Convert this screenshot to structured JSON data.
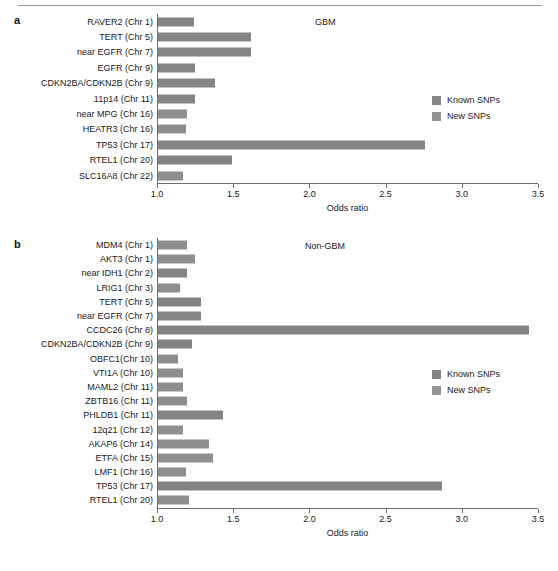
{
  "figure": {
    "axis_title": "Odds ratio",
    "legend": {
      "known_label": "Known SNPs",
      "new_label": "New SNPs",
      "known_color": "#848484",
      "new_color": "#949494"
    },
    "tick_labels": [
      "1.0",
      "1.5",
      "2.0",
      "2.5",
      "3.0",
      "3.5"
    ],
    "xlim": [
      1.0,
      3.5
    ]
  },
  "panels": [
    {
      "letter": "a",
      "title": "GBM"
    },
    {
      "letter": "b",
      "title": "Non-GBM"
    }
  ],
  "chart_data": [
    {
      "type": "bar",
      "orientation": "horizontal",
      "title": "GBM",
      "panel": "a",
      "xlabel": "Odds ratio",
      "ylabel": "",
      "xlim": [
        1.0,
        3.5
      ],
      "xticks": [
        1.0,
        1.5,
        2.0,
        2.5,
        3.0,
        3.5
      ],
      "grid": false,
      "legend": [
        "Known SNPs",
        "New SNPs"
      ],
      "legend_position": "right",
      "categories": [
        "RAVER2 (Chr 1)",
        "TERT (Chr 5)",
        "near EGFR (Chr 7)",
        "EGFR (Chr 9)",
        "CDKN2BA/CDKN2B (Chr 9)",
        "11p14 (Chr 11)",
        "near MPG (Chr 16)",
        "HEATR3 (Chr 16)",
        "TP53 (Chr 17)",
        "RTEL1 (Chr 20)",
        "SLC16A8 (Chr 22)"
      ],
      "values": [
        1.24,
        1.62,
        1.62,
        1.25,
        1.38,
        1.25,
        1.2,
        1.19,
        2.76,
        1.49,
        1.17
      ],
      "series_of": [
        "Known SNPs",
        "Known SNPs",
        "Known SNPs",
        "Known SNPs",
        "Known SNPs",
        "Known SNPs",
        "New SNPs",
        "New SNPs",
        "Known SNPs",
        "Known SNPs",
        "New SNPs"
      ]
    },
    {
      "type": "bar",
      "orientation": "horizontal",
      "title": "Non-GBM",
      "panel": "b",
      "xlabel": "Odds ratio",
      "ylabel": "",
      "xlim": [
        1.0,
        3.5
      ],
      "xticks": [
        1.0,
        1.5,
        2.0,
        2.5,
        3.0,
        3.5
      ],
      "grid": false,
      "legend": [
        "Known SNPs",
        "New SNPs"
      ],
      "legend_position": "right",
      "categories": [
        "MDM4 (Chr 1)",
        "AKT3 (Chr 1)",
        "near IDH1 (Chr 2)",
        "LRIG1 (Chr 3)",
        "TERT (Chr 5)",
        "near EGFR (Chr 7)",
        "CCDC26 (Chr 8)",
        "CDKN2BA/CDKN2B (Chr 9)",
        "OBFC1(Chr 10)",
        "VTI1A (Chr 10)",
        "MAML2 (Chr 11)",
        "ZBTB16 (Chr 11)",
        "PHLDB1 (Chr 11)",
        "12q21 (Chr 12)",
        "AKAP6 (Chr 14)",
        "ETFA (Chr 15)",
        "LMF1 (Chr 16)",
        "TP53 (Chr 17)",
        "RTEL1 (Chr 20)"
      ],
      "values": [
        1.2,
        1.25,
        1.2,
        1.15,
        1.29,
        1.29,
        3.44,
        1.23,
        1.14,
        1.17,
        1.17,
        1.2,
        1.43,
        1.17,
        1.34,
        1.37,
        1.19,
        2.87,
        1.21
      ],
      "series_of": [
        "New SNPs",
        "New SNPs",
        "Known SNPs",
        "New SNPs",
        "Known SNPs",
        "Known SNPs",
        "Known SNPs",
        "Known SNPs",
        "New SNPs",
        "New SNPs",
        "New SNPs",
        "New SNPs",
        "Known SNPs",
        "New SNPs",
        "New SNPs",
        "New SNPs",
        "New SNPs",
        "Known SNPs",
        "New SNPs"
      ]
    }
  ]
}
